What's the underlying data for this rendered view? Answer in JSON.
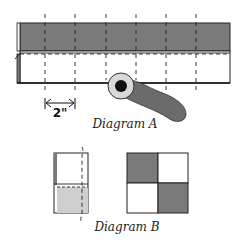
{
  "diagram_a": {
    "caption": "Diagram A",
    "dimension_label": "2\"",
    "colors": {
      "dark_strip": "#7a7a7a",
      "light_strip": "#ffffff",
      "outline": "#222222",
      "cutter_ring": "#d9d9d9",
      "cutter_hub": "#111111",
      "cutter_handle": "#6b6b6b"
    },
    "cut_lines_count": 6
  },
  "diagram_b": {
    "caption": "Diagram B",
    "colors": {
      "dark": "#7a7a7a",
      "light_gray": "#cfcfcf",
      "white": "#ffffff",
      "outline": "#222222"
    },
    "four_patch": [
      [
        "dark",
        "white"
      ],
      [
        "white",
        "dark"
      ]
    ]
  }
}
